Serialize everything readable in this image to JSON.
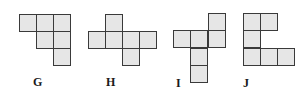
{
  "diagram": {
    "type": "cube-nets",
    "cell_size_px": 17,
    "colors": {
      "fill": "#e6e6e6",
      "stroke": "#3a3a3a",
      "label": "#1a1a1a"
    },
    "figures": [
      {
        "label": "G",
        "label_pos": [
          33,
          76
        ],
        "cells": [
          [
            19,
            14
          ],
          [
            36,
            14
          ],
          [
            53,
            14
          ],
          [
            36,
            31
          ],
          [
            53,
            31
          ],
          [
            53,
            48
          ]
        ]
      },
      {
        "label": "H",
        "label_pos": [
          106,
          76
        ],
        "cells": [
          [
            105,
            14
          ],
          [
            88,
            31
          ],
          [
            105,
            31
          ],
          [
            122,
            31
          ],
          [
            139,
            31
          ],
          [
            122,
            48
          ]
        ]
      },
      {
        "label": "I",
        "label_pos": [
          176,
          77
        ],
        "cells": [
          [
            208,
            13
          ],
          [
            173,
            30
          ],
          [
            190,
            30
          ],
          [
            208,
            30
          ],
          [
            190,
            48
          ],
          [
            190,
            65
          ]
        ]
      },
      {
        "label": "J",
        "label_pos": [
          243,
          77
        ],
        "cells": [
          [
            243,
            13
          ],
          [
            260,
            13
          ],
          [
            243,
            30
          ],
          [
            243,
            48
          ],
          [
            260,
            48
          ],
          [
            277,
            48
          ]
        ]
      }
    ]
  }
}
